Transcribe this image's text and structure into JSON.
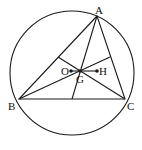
{
  "diagram": {
    "type": "geometry",
    "labels": {
      "A": "A",
      "B": "B",
      "C": "C",
      "O": "O",
      "G": "G",
      "H": "H"
    },
    "colors": {
      "stroke": "#1a1a1a",
      "background": "#ffffff"
    }
  }
}
